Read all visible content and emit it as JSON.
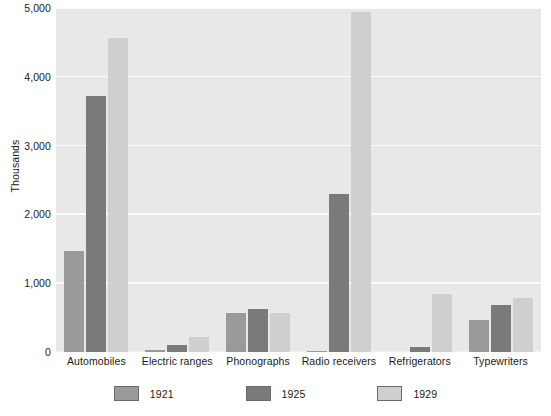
{
  "chart_data": {
    "type": "bar",
    "title": "",
    "xlabel": "",
    "ylabel": "Thousands",
    "ylim": [
      0,
      5000
    ],
    "yticks": [
      0,
      1000,
      2000,
      3000,
      4000,
      5000
    ],
    "ytick_labels": [
      "0",
      "1,000",
      "2,000",
      "3,000",
      "4,000",
      "5,000"
    ],
    "grid": true,
    "legend_position": "bottom",
    "categories": [
      "Automobiles",
      "Electric ranges",
      "Phonographs",
      "Radio receivers",
      "Refrigerators",
      "Typewriters"
    ],
    "series": [
      {
        "name": "1921",
        "color": "#9a9a9a",
        "values": [
          1468,
          30,
          565,
          12,
          5,
          460
        ]
      },
      {
        "name": "1925",
        "color": "#7a7a7a",
        "values": [
          3725,
          105,
          620,
          2300,
          75,
          680
        ]
      },
      {
        "name": "1929",
        "color": "#cfcfcf",
        "values": [
          4570,
          220,
          565,
          4940,
          840,
          790
        ]
      }
    ]
  },
  "style": {
    "plot_background": "#e8e8e8",
    "gridline_color": "#fbfbfb",
    "text_color": "#1a1a1a",
    "page_background": "#ffffff"
  }
}
